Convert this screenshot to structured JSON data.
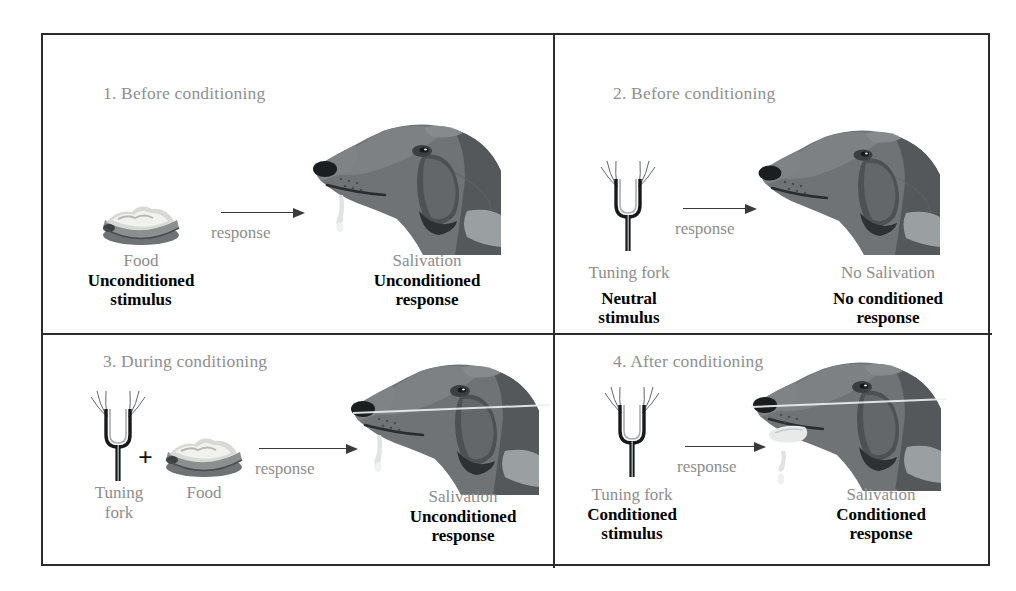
{
  "figure": {
    "colors": {
      "border": "#2b2b2b",
      "heading_gray": "#8f8f8f",
      "soft_label_gray": "#8d8d8d",
      "strong_label_black": "#000000",
      "arrow": "#3a3a3a",
      "dog_dark": "#55585a",
      "dog_mid": "#75797b",
      "dog_light": "#9aa0a1",
      "dog_pale": "#b9bebd",
      "background": "#ffffff"
    },
    "arrow_label": "response"
  },
  "panels": [
    {
      "id": "panel-1",
      "heading": "1. Before conditioning",
      "stimulus": {
        "name": "Food",
        "term_line1": "Unconditioned",
        "term_line2": "stimulus",
        "icon": "food-bowl-icon"
      },
      "response": {
        "name": "Salivation",
        "term_line1": "Unconditioned",
        "term_line2": "response",
        "icon": "dog-head-salivating-icon"
      },
      "arrow_label": "response",
      "has_plus": false,
      "dog_state": "salivating"
    },
    {
      "id": "panel-2",
      "heading": "2. Before conditioning",
      "stimulus": {
        "name": "Tuning fork",
        "term_line1": "Neutral",
        "term_line2": "stimulus",
        "icon": "tuning-fork-icon"
      },
      "response": {
        "name": "No Salivation",
        "term_line1": "No conditioned",
        "term_line2": "response",
        "icon": "dog-head-icon"
      },
      "arrow_label": "response",
      "has_plus": false,
      "dog_state": "no-salivation"
    },
    {
      "id": "panel-3",
      "heading": "3. During conditioning",
      "stimulus": {
        "name": "Tuning",
        "name_line2": "fork",
        "second_name": "Food",
        "plus": "+",
        "term_line1": "",
        "term_line2": "",
        "icon": "tuning-fork-icon",
        "icon2": "food-bowl-icon"
      },
      "response": {
        "name": "Salivation",
        "term_line1": "Unconditioned",
        "term_line2": "response",
        "icon": "dog-head-salivating-icon"
      },
      "arrow_label": "response",
      "has_plus": true,
      "dog_state": "salivating"
    },
    {
      "id": "panel-4",
      "heading": "4. After conditioning",
      "stimulus": {
        "name": "Tuning fork",
        "term_line1": "Conditioned",
        "term_line2": "stimulus",
        "icon": "tuning-fork-icon"
      },
      "response": {
        "name": "Salivation",
        "term_line1": "Conditioned",
        "term_line2": "response",
        "icon": "dog-head-drooling-icon"
      },
      "arrow_label": "response",
      "has_plus": false,
      "dog_state": "drooling-tongue"
    }
  ]
}
